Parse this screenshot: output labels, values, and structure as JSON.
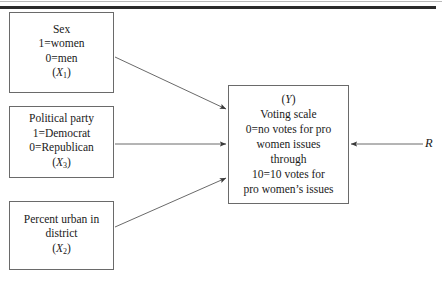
{
  "figure": {
    "title": "",
    "line_color": "#6a6a6a",
    "text_color": "#1a1a1a",
    "rule_color": "#2b2b2b",
    "background": "#ffffff"
  },
  "boxes": {
    "sex": {
      "name": "Sex",
      "lines": [
        "Sex",
        "1=women",
        "0=men"
      ],
      "variable": "X",
      "subscript": "1"
    },
    "party": {
      "name": "Political party",
      "lines": [
        "Political party",
        "1=Democrat",
        "0=Republican"
      ],
      "variable": "X",
      "subscript": "3"
    },
    "urban": {
      "name": "Percent urban in district",
      "lines": [
        "Percent urban in",
        "district"
      ],
      "variable": "X",
      "subscript": "2"
    },
    "voting": {
      "name": "Voting scale",
      "variable": "Y",
      "lines": [
        "Voting scale",
        "0=no votes for pro",
        "women issues",
        "through",
        "10=10 votes for",
        "pro women’s issues"
      ]
    }
  },
  "residual": {
    "label": "R"
  },
  "arrows": [
    {
      "name": "sex-to-voting",
      "from": "sex",
      "to": "voting"
    },
    {
      "name": "party-to-voting",
      "from": "party",
      "to": "voting"
    },
    {
      "name": "urban-to-voting",
      "from": "urban",
      "to": "voting"
    },
    {
      "name": "residual-to-voting",
      "from": "residual",
      "to": "voting"
    }
  ]
}
